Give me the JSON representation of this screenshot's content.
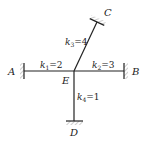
{
  "diagram": {
    "type": "spring-rod system",
    "junction": {
      "label": "E"
    },
    "supports": [
      {
        "id": "A",
        "label": "A",
        "side": "left"
      },
      {
        "id": "B",
        "label": "B",
        "side": "right"
      },
      {
        "id": "C",
        "label": "C",
        "side": "upper-right"
      },
      {
        "id": "D",
        "label": "D",
        "side": "bottom"
      }
    ],
    "members": [
      {
        "from": "A",
        "to": "E",
        "k_label": "k",
        "k_sub": "1",
        "k_value": "=2"
      },
      {
        "from": "E",
        "to": "B",
        "k_label": "k",
        "k_sub": "2",
        "k_value": "=3"
      },
      {
        "from": "E",
        "to": "C",
        "k_label": "k",
        "k_sub": "3",
        "k_value": "=4"
      },
      {
        "from": "E",
        "to": "D",
        "k_label": "k",
        "k_sub": "4",
        "k_value": "=1"
      }
    ],
    "colors": {
      "line": "#222222",
      "background": "#ffffff"
    }
  }
}
